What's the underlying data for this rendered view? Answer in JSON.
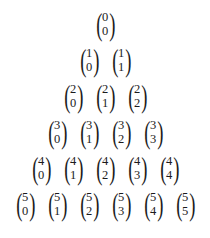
{
  "figure": {
    "name": "pascals-triangle-binomial-coefficients",
    "background_color": "#ffffff",
    "text_color": "#1b1b1b",
    "delimiters": {
      "left": "(",
      "right": ")"
    },
    "rows": [
      {
        "n": 0,
        "cells": [
          {
            "top": "0",
            "bottom": "0"
          }
        ]
      },
      {
        "n": 1,
        "cells": [
          {
            "top": "1",
            "bottom": "0"
          },
          {
            "top": "1",
            "bottom": "1"
          }
        ]
      },
      {
        "n": 2,
        "cells": [
          {
            "top": "2",
            "bottom": "0"
          },
          {
            "top": "2",
            "bottom": "1"
          },
          {
            "top": "2",
            "bottom": "2"
          }
        ]
      },
      {
        "n": 3,
        "cells": [
          {
            "top": "3",
            "bottom": "0"
          },
          {
            "top": "3",
            "bottom": "1"
          },
          {
            "top": "3",
            "bottom": "2"
          },
          {
            "top": "3",
            "bottom": "3"
          }
        ]
      },
      {
        "n": 4,
        "cells": [
          {
            "top": "4",
            "bottom": "0"
          },
          {
            "top": "4",
            "bottom": "1"
          },
          {
            "top": "4",
            "bottom": "2"
          },
          {
            "top": "4",
            "bottom": "3"
          },
          {
            "top": "4",
            "bottom": "4"
          }
        ]
      },
      {
        "n": 5,
        "cells": [
          {
            "top": "5",
            "bottom": "0"
          },
          {
            "top": "5",
            "bottom": "1"
          },
          {
            "top": "5",
            "bottom": "2"
          },
          {
            "top": "5",
            "bottom": "3"
          },
          {
            "top": "5",
            "bottom": "4"
          },
          {
            "top": "5",
            "bottom": "5"
          }
        ]
      }
    ]
  }
}
